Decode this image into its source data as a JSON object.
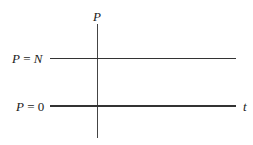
{
  "diagram": {
    "vertical_axis_label": "P",
    "horizontal_axis_label": "t",
    "lines": [
      {
        "label_var": "P",
        "label_eq": " = ",
        "label_val": "N"
      },
      {
        "label_var": "P",
        "label_eq": " = ",
        "label_val": "0"
      }
    ]
  }
}
